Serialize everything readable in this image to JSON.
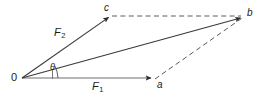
{
  "figure": {
    "background_color": "#ffffff",
    "stroke_color": "#2b2b2b",
    "text_color": "#1b1b1b",
    "width": 260,
    "height": 97,
    "labels": {
      "origin": "0",
      "point_a": "a",
      "point_b": "b",
      "point_c": "c",
      "force_1": "F",
      "force_1_sub": "1",
      "force_2": "F",
      "force_2_sub": "2",
      "angle": "θ"
    },
    "points": {
      "origin": {
        "x": 22,
        "y": 78
      },
      "a": {
        "x": 153,
        "y": 78
      },
      "b": {
        "x": 243,
        "y": 17
      },
      "c": {
        "x": 110,
        "y": 16
      }
    },
    "vectors": [
      {
        "name": "F1",
        "from": "origin",
        "to": "a",
        "style": "solid",
        "arrow": true
      },
      {
        "name": "F2",
        "from": "origin",
        "to": "c",
        "style": "solid",
        "arrow": true
      },
      {
        "name": "resultant",
        "from": "origin",
        "to": "b",
        "style": "solid",
        "arrow": true
      }
    ],
    "construction_lines": [
      {
        "name": "c-to-b",
        "from": "c",
        "to": "b",
        "style": "dashed",
        "arrow": false
      },
      {
        "name": "a-to-b",
        "from": "a",
        "to": "b",
        "style": "dashed",
        "arrow": false
      }
    ],
    "angle_arc": {
      "name": "theta-arc",
      "vertex": "origin",
      "between": [
        "F1",
        "resultant"
      ]
    },
    "tick_mark": {
      "name": "angle-tick",
      "x": 52,
      "y_top": 70,
      "y_bottom": 79
    }
  }
}
